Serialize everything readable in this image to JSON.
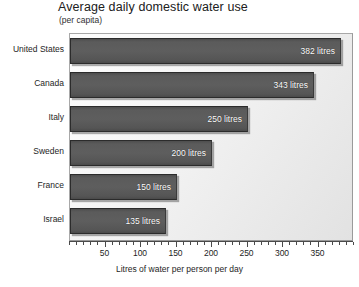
{
  "chart_data": {
    "type": "bar",
    "orientation": "horizontal",
    "title": "Average daily domestic water use",
    "subtitle": "(per capita)",
    "xlabel": "Litres of water per person per day",
    "ylabel": "",
    "unit": "litres",
    "categories": [
      "United States",
      "Canada",
      "Italy",
      "Sweden",
      "France",
      "Israel"
    ],
    "values": [
      382,
      343,
      250,
      200,
      150,
      135
    ],
    "data_labels": [
      "382 litres",
      "343 litres",
      "250 litres",
      "200 litres",
      "150 litres",
      "135 litres"
    ],
    "xlim": [
      0,
      400
    ],
    "xticks": [
      50,
      100,
      150,
      200,
      250,
      300,
      350
    ],
    "xtick_labels": [
      "50",
      "100",
      "150",
      "200",
      "250",
      "300",
      "350"
    ],
    "minor_tick_step": 10,
    "grid": false,
    "legend": null,
    "colors": {
      "bar_fill": "#5a5a5a",
      "bar_edge": "#2b2b2b",
      "data_label": "#ffffff",
      "plot_background": "#f0f0f0",
      "plot_border": "#9a9a9a",
      "axis": "#4a4a4a",
      "text": "#1e1e1e"
    }
  }
}
